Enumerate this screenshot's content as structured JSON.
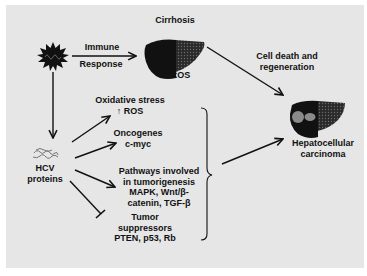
{
  "diagram": {
    "title": "Cirrhosis",
    "virus": {
      "icon": "hcv-virus-icon"
    },
    "immune_arrow": {
      "top_label": "Immune",
      "bottom_label": "Response"
    },
    "cirrhotic_liver": {
      "label": "↑ ROS",
      "icon": "cirrhotic-liver-icon"
    },
    "cell_death": {
      "line1": "Cell death and",
      "line2": "regeneration"
    },
    "hcc_liver": {
      "line1": "Hepatocellular",
      "line2": "carcinoma",
      "icon": "tumor-liver-icon"
    },
    "hcv_proteins": {
      "line1": "HCV",
      "line2": "proteins",
      "icon": "protein-structure-icon"
    },
    "effects": [
      {
        "lines": [
          "Oxidative stress",
          "↑ ROS"
        ],
        "arrow": "activates"
      },
      {
        "lines": [
          "Oncogenes",
          "c-myc"
        ],
        "arrow": "activates"
      },
      {
        "lines": [
          "Pathways involved",
          "in tumorigenesis",
          "MAPK, Wnt/β-",
          "catenin, TGF-β"
        ],
        "arrow": "activates"
      },
      {
        "lines": [
          "Tumor",
          "suppressors",
          "PTEN, p53, Rb"
        ],
        "arrow": "inhibits"
      }
    ],
    "colors": {
      "background": "#e6e6e6",
      "ink": "#111111",
      "cirrhotic_tissue": "#3a3a3a",
      "tumor_nodule": "#8a8a8a"
    }
  }
}
